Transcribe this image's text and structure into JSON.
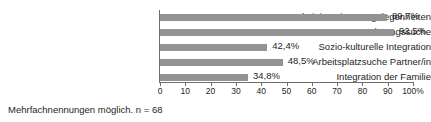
{
  "chart_data": {
    "type": "bar",
    "orientation": "horizontal",
    "title": "",
    "xlabel": "",
    "ylabel": "",
    "xlim": [
      0,
      100
    ],
    "grid": false,
    "legend": null,
    "bar_color": "#939393",
    "axis_color": "#6e6e6e",
    "categories": [
      "Administrativen Angelegenheiten",
      "Wohnungssuche",
      "Sozio-kulturelle Integration",
      "Arbeitsplatzsuche Partner/in",
      "Integration der Familie"
    ],
    "values": [
      89.7,
      92.5,
      42.4,
      48.5,
      34.8
    ],
    "value_labels": [
      "89,7%",
      "92,5%",
      "42,4%",
      "48,5%",
      "34,8%"
    ],
    "xticks": [
      0,
      10,
      20,
      30,
      40,
      50,
      60,
      70,
      80,
      90,
      100
    ],
    "xtick_labels": [
      "0",
      "10",
      "20",
      "30",
      "40",
      "50",
      "60",
      "70",
      "80",
      "90",
      "100%"
    ]
  },
  "footnote": "Mehrfachnennungen möglich. n = 68"
}
